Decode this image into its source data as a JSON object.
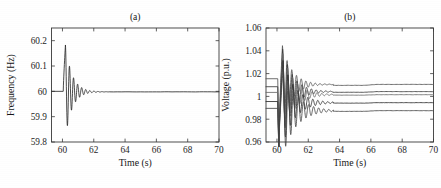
{
  "figure": {
    "background_color": "#ffffff",
    "axis_color": "#3a3a3a",
    "text_color": "#161616"
  },
  "chart_data": [
    {
      "type": "line",
      "panel_label": "(a)",
      "title": "",
      "xlabel": "Time (s)",
      "ylabel": "Frequency (Hz)",
      "xlim": [
        59.3,
        70
      ],
      "ylim": [
        59.8,
        60.25
      ],
      "xticks": [
        60,
        62,
        64,
        66,
        68,
        70
      ],
      "xticklabels": [
        "60",
        "62",
        "64",
        "66",
        "68",
        "70"
      ],
      "yticks": [
        59.8,
        59.9,
        60,
        60.1,
        60.2
      ],
      "yticklabels": [
        "59.8",
        "59.9",
        "60",
        "60.1",
        "60.2"
      ],
      "grid": false,
      "legend": false,
      "series": [
        {
          "name": "system frequency",
          "color": "#2a2a2a",
          "steady_state_before": 60.0,
          "event_time": 60.05,
          "peak_value": 60.183,
          "peak_time": 60.19,
          "trough_value": 59.922,
          "trough_time": 60.32,
          "settle_value": 59.998,
          "settle_time": 62.4,
          "damping_ratio": 0.11,
          "oscillation_period": 0.26,
          "x": [
            59.3,
            59.6,
            60.0,
            60.05,
            60.1,
            60.19,
            60.26,
            60.32,
            60.41,
            60.47,
            60.56,
            60.62,
            60.71,
            60.78,
            60.87,
            60.95,
            61.05,
            61.15,
            61.3,
            61.5,
            61.8,
            62.2,
            62.8,
            64.0,
            66.0,
            68.0,
            70.0
          ],
          "y": [
            60.0,
            60.0,
            60.0,
            60.0,
            60.09,
            60.183,
            60.03,
            59.922,
            60.02,
            60.062,
            59.957,
            59.982,
            60.028,
            59.978,
            60.014,
            59.99,
            60.006,
            59.995,
            60.001,
            59.998,
            60.0,
            59.999,
            59.998,
            59.998,
            59.998,
            59.998,
            59.998
          ]
        }
      ]
    },
    {
      "type": "line",
      "panel_label": "(b)",
      "title": "",
      "xlabel": "Time (s)",
      "ylabel": "Voltage (p.u.)",
      "xlim": [
        59.3,
        70
      ],
      "ylim": [
        0.96,
        1.06
      ],
      "xticks": [
        60,
        62,
        64,
        66,
        68,
        70
      ],
      "xticklabels": [
        "60",
        "62",
        "64",
        "66",
        "68",
        "70"
      ],
      "yticks": [
        0.96,
        0.98,
        1.0,
        1.02,
        1.04,
        1.06
      ],
      "yticklabels": [
        "0.96",
        "0.98",
        "1",
        "1.02",
        "1.04",
        "1.06"
      ],
      "grid": false,
      "legend": false,
      "event_time": 60.05,
      "peak_value": 1.045,
      "min_value": 0.958,
      "series": [
        {
          "name": "bus voltage 1",
          "color": "#555555",
          "initial_value": 1.0155,
          "peak_value": 1.0445,
          "final_value": 1.0105,
          "step_time": 65.6,
          "step_delta": 0.0008
        },
        {
          "name": "bus voltage 2",
          "color": "#3c3c3c",
          "initial_value": 1.0085,
          "peak_value": 1.0415,
          "final_value": 1.0042,
          "step_time": 65.6,
          "step_delta": 0.0006
        },
        {
          "name": "bus voltage 3",
          "color": "#6a6a6a",
          "initial_value": 1.0035,
          "peak_value": 1.0375,
          "final_value": 1.0015,
          "step_time": 65.6,
          "step_delta": 0.0004
        },
        {
          "name": "bus voltage 4",
          "color": "#2e2e2e",
          "initial_value": 0.9955,
          "peak_value": 1.0315,
          "final_value": 0.9945,
          "step_time": 65.6,
          "step_delta": 0.0004
        },
        {
          "name": "bus voltage 5",
          "color": "#464646",
          "initial_value": 0.9895,
          "peak_value": 1.0255,
          "final_value": 0.9875,
          "step_time": 65.6,
          "step_delta": 0.0006
        }
      ]
    }
  ]
}
